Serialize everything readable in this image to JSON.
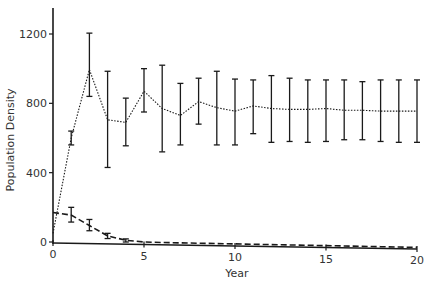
{
  "chart_data": {
    "type": "line",
    "title": "",
    "xlabel": "Year",
    "ylabel": "Population Density",
    "xlim": [
      0,
      20
    ],
    "ylim": [
      0,
      1350
    ],
    "xticks": [
      0,
      5,
      10,
      15,
      20
    ],
    "yticks": [
      0,
      400,
      800,
      1200
    ],
    "grid": false,
    "legend": null,
    "x": [
      0,
      1,
      2,
      3,
      4,
      5,
      6,
      7,
      8,
      9,
      10,
      11,
      12,
      13,
      14,
      15,
      16,
      17,
      18,
      19,
      20
    ],
    "series": [
      {
        "name": "upper (dotted)",
        "style": "dotted",
        "values": [
          50,
          600,
          995,
          705,
          690,
          870,
          770,
          730,
          810,
          775,
          755,
          785,
          770,
          765,
          765,
          770,
          760,
          760,
          755,
          755,
          755
        ],
        "err_low": [
          null,
          560,
          840,
          430,
          555,
          750,
          520,
          560,
          680,
          560,
          560,
          625,
          575,
          580,
          575,
          580,
          590,
          590,
          580,
          575,
          575
        ],
        "err_high": [
          null,
          640,
          1205,
          985,
          830,
          1000,
          1020,
          915,
          945,
          985,
          940,
          935,
          960,
          945,
          935,
          935,
          935,
          925,
          935,
          935,
          935
        ]
      },
      {
        "name": "lower (dashed)",
        "style": "dashed",
        "values": [
          170,
          155,
          95,
          35,
          10,
          0,
          -3,
          -5,
          -7,
          -9,
          -11,
          -13,
          -15,
          -17,
          -19,
          -21,
          -23,
          -25,
          -27,
          -29,
          -31
        ],
        "err_low": [
          null,
          115,
          65,
          20,
          0,
          null,
          null,
          null,
          null,
          null,
          null,
          null,
          null,
          null,
          null,
          null,
          null,
          null,
          null,
          null,
          null
        ],
        "err_high": [
          null,
          200,
          130,
          50,
          18,
          null,
          null,
          null,
          null,
          null,
          null,
          null,
          null,
          null,
          null,
          null,
          null,
          null,
          null,
          null,
          null
        ]
      }
    ]
  },
  "labels": {
    "xlabel": "Year",
    "ylabel": "Population Density",
    "yticks": [
      "0",
      "400",
      "800",
      "1200"
    ],
    "xticks": [
      "0",
      "5",
      "10",
      "15",
      "20"
    ]
  },
  "colors": {
    "ink": "#1a1a1a",
    "background": "#ffffff"
  }
}
